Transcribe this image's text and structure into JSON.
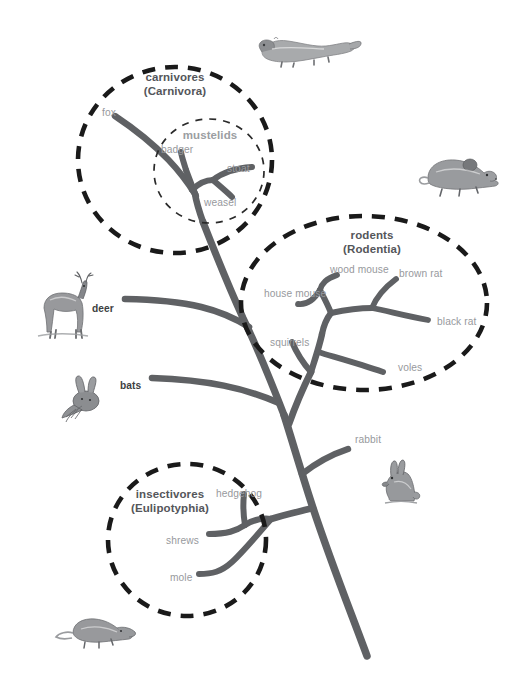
{
  "diagram": {
    "type": "phylogenetic-tree",
    "background_color": "#ffffff",
    "branch_color": "#5f6164",
    "outline_color": "#1a1a1a",
    "label_color": "#97999d",
    "heading_color": "#54565a"
  },
  "groups": [
    {
      "id": "carnivores",
      "label_common": "carnivores",
      "label_scientific": "(Carnivora)",
      "cx": 175,
      "cy": 160,
      "rx": 97,
      "ry": 93,
      "label_x": 175,
      "label_y": 70,
      "dash": "13 10",
      "stroke_width": 4.6,
      "style": "heavy"
    },
    {
      "id": "mustelids",
      "label_common": "mustelids",
      "label_scientific": "",
      "cx": 209,
      "cy": 171,
      "rx": 55,
      "ry": 52,
      "label_x": 210,
      "label_y": 128,
      "dash": "7 7",
      "stroke_width": 1.7,
      "style": "light"
    },
    {
      "id": "rodents",
      "label_common": "rodents",
      "label_scientific": "(Rodentia)",
      "cx": 364,
      "cy": 303,
      "rx": 123,
      "ry": 87,
      "label_x": 372,
      "label_y": 228,
      "dash": "13 10",
      "stroke_width": 4.6,
      "style": "heavy"
    },
    {
      "id": "insectivores",
      "label_common": "insectivores",
      "label_scientific": "(Eulipotyphia)",
      "cx": 187,
      "cy": 540,
      "rx": 79,
      "ry": 76,
      "label_x": 170,
      "label_y": 487,
      "dash": "13 10",
      "stroke_width": 4.6,
      "style": "heavy"
    }
  ],
  "tips": [
    {
      "id": "fox",
      "label": "fox",
      "x": 102,
      "y": 107,
      "align": "left",
      "emphasis": "normal"
    },
    {
      "id": "badger",
      "label": "badger",
      "x": 161,
      "y": 144,
      "align": "left",
      "emphasis": "normal"
    },
    {
      "id": "stoat",
      "label": "stoat",
      "x": 227,
      "y": 163,
      "align": "left",
      "emphasis": "normal"
    },
    {
      "id": "weasel",
      "label": "weasel",
      "x": 204,
      "y": 197,
      "align": "left",
      "emphasis": "normal"
    },
    {
      "id": "deer",
      "label": "deer",
      "x": 92,
      "y": 303,
      "align": "left",
      "emphasis": "bold"
    },
    {
      "id": "bats",
      "label": "bats",
      "x": 120,
      "y": 380,
      "align": "left",
      "emphasis": "bold"
    },
    {
      "id": "house-mouse",
      "label": "house mouse",
      "x": 264,
      "y": 288,
      "align": "left",
      "emphasis": "normal"
    },
    {
      "id": "wood-mouse",
      "label": "wood mouse",
      "x": 330,
      "y": 264,
      "align": "left",
      "emphasis": "normal"
    },
    {
      "id": "brown-rat",
      "label": "brown rat",
      "x": 399,
      "y": 268,
      "align": "left",
      "emphasis": "normal"
    },
    {
      "id": "black-rat",
      "label": "black rat",
      "x": 437,
      "y": 316,
      "align": "left",
      "emphasis": "normal"
    },
    {
      "id": "squirrels",
      "label": "squirrels",
      "x": 270,
      "y": 337,
      "align": "left",
      "emphasis": "normal"
    },
    {
      "id": "voles",
      "label": "voles",
      "x": 398,
      "y": 362,
      "align": "left",
      "emphasis": "normal"
    },
    {
      "id": "rabbit",
      "label": "rabbit",
      "x": 355,
      "y": 434,
      "align": "left",
      "emphasis": "normal"
    },
    {
      "id": "hedgehog",
      "label": "hedgehog",
      "x": 216,
      "y": 488,
      "align": "left",
      "emphasis": "normal"
    },
    {
      "id": "shrews",
      "label": "shrews",
      "x": 166,
      "y": 535,
      "align": "left",
      "emphasis": "normal"
    },
    {
      "id": "mole",
      "label": "mole",
      "x": 170,
      "y": 572,
      "align": "left",
      "emphasis": "normal"
    }
  ],
  "animals": [
    {
      "id": "stoat-illustration",
      "name": "stoat",
      "x": 252,
      "y": 22,
      "w": 110,
      "h": 46
    },
    {
      "id": "rat-illustration",
      "name": "rat",
      "x": 422,
      "y": 150,
      "w": 78,
      "h": 50
    },
    {
      "id": "deer-illustration",
      "name": "deer",
      "x": 38,
      "y": 272,
      "w": 52,
      "h": 66
    },
    {
      "id": "bat-illustration",
      "name": "bat",
      "x": 60,
      "y": 375,
      "w": 50,
      "h": 50
    },
    {
      "id": "rabbit-illustration",
      "name": "rabbit",
      "x": 377,
      "y": 450,
      "w": 48,
      "h": 56
    },
    {
      "id": "shrew-illustration",
      "name": "shrew",
      "x": 55,
      "y": 607,
      "w": 82,
      "h": 44
    }
  ]
}
